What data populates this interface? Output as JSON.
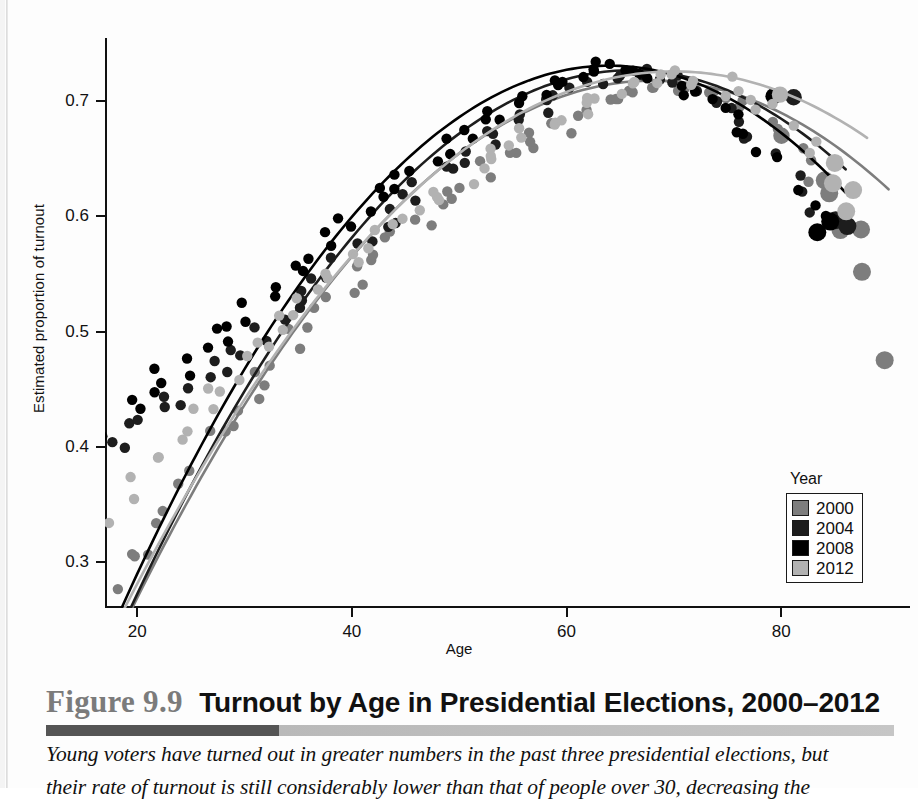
{
  "figure": {
    "number": "Figure 9.9",
    "title": "Turnout by Age in Presidential Elections, 2000–2012",
    "caption_line1": "Young voters have turned out in greater numbers in the past three presidential elections, but",
    "caption_line2": "their rate of turnout is still considerably lower than that of people over 30, decreasing the"
  },
  "legend": {
    "title": "Year",
    "items": [
      {
        "label": "2000",
        "color": "#7d7d7d"
      },
      {
        "label": "2004",
        "color": "#1d1d1d"
      },
      {
        "label": "2008",
        "color": "#000000"
      },
      {
        "label": "2012",
        "color": "#b2b2b2"
      }
    ]
  },
  "chart_data": {
    "type": "scatter",
    "title": "Turnout by Age in Presidential Elections, 2000–2012",
    "xlabel": "Age",
    "ylabel": "Estimated proportion of turnout",
    "xlim": [
      17,
      92
    ],
    "ylim": [
      0.26,
      0.755
    ],
    "xticks": [
      20,
      40,
      60,
      80
    ],
    "yticks": [
      0.3,
      0.4,
      0.5,
      0.6,
      0.7
    ],
    "ytick_labels": [
      "0.3",
      "0.4",
      "0.5",
      "0.6",
      "0.7"
    ],
    "xtick_labels": [
      "20",
      "40",
      "60",
      "80"
    ],
    "grid": false,
    "legend_position": "lower-right",
    "series": [
      {
        "name": "2000",
        "color": "#7d7d7d",
        "fit": {
          "kind": "quadratic",
          "vertex_x": 68,
          "vertex_y": 0.718,
          "curvature": -0.000195,
          "x_start": 18,
          "x_end": 90
        },
        "points": [
          [
            18,
            0.277
          ],
          [
            19,
            0.302
          ],
          [
            20,
            0.303
          ],
          [
            21,
            0.306
          ],
          [
            22,
            0.337
          ],
          [
            23,
            0.347
          ],
          [
            24,
            0.372
          ],
          [
            25,
            0.378
          ],
          [
            26,
            0.409
          ],
          [
            27,
            0.414
          ],
          [
            28,
            0.419
          ],
          [
            29,
            0.435
          ],
          [
            30,
            0.437
          ],
          [
            31,
            0.455
          ],
          [
            32,
            0.468
          ],
          [
            33,
            0.474
          ],
          [
            34,
            0.487
          ],
          [
            35,
            0.498
          ],
          [
            36,
            0.503
          ],
          [
            37,
            0.516
          ],
          [
            38,
            0.526
          ],
          [
            39,
            0.536
          ],
          [
            40,
            0.543
          ],
          [
            41,
            0.556
          ],
          [
            42,
            0.562
          ],
          [
            43,
            0.571
          ],
          [
            44,
            0.579
          ],
          [
            45,
            0.588
          ],
          [
            46,
            0.597
          ],
          [
            47,
            0.602
          ],
          [
            48,
            0.611
          ],
          [
            49,
            0.613
          ],
          [
            50,
            0.624
          ],
          [
            51,
            0.629
          ],
          [
            52,
            0.633
          ],
          [
            53,
            0.645
          ],
          [
            54,
            0.652
          ],
          [
            55,
            0.657
          ],
          [
            56,
            0.664
          ],
          [
            57,
            0.668
          ],
          [
            58,
            0.672
          ],
          [
            59,
            0.677
          ],
          [
            60,
            0.684
          ],
          [
            61,
            0.688
          ],
          [
            62,
            0.692
          ],
          [
            63,
            0.697
          ],
          [
            64,
            0.701
          ],
          [
            65,
            0.703
          ],
          [
            66,
            0.708
          ],
          [
            67,
            0.711
          ],
          [
            68,
            0.714
          ],
          [
            69,
            0.715
          ],
          [
            70,
            0.716
          ],
          [
            71,
            0.714
          ],
          [
            72,
            0.712
          ],
          [
            73,
            0.711
          ],
          [
            74,
            0.706
          ],
          [
            75,
            0.702
          ],
          [
            76,
            0.698
          ],
          [
            77,
            0.692
          ],
          [
            78,
            0.686
          ],
          [
            79,
            0.678
          ],
          [
            80,
            0.671
          ],
          [
            81,
            0.659
          ],
          [
            82,
            0.647
          ],
          [
            83,
            0.634
          ],
          [
            84,
            0.621
          ],
          [
            85,
            0.631
          ],
          [
            86,
            0.592
          ],
          [
            87,
            0.588
          ],
          [
            88,
            0.552
          ],
          [
            89,
            0.478
          ]
        ]
      },
      {
        "name": "2004",
        "color": "#1d1d1d",
        "fit": {
          "kind": "quadratic",
          "vertex_x": 66,
          "vertex_y": 0.727,
          "curvature": -0.000215,
          "x_start": 18,
          "x_end": 86
        },
        "points": [
          [
            18,
            0.401
          ],
          [
            19,
            0.407
          ],
          [
            20,
            0.418
          ],
          [
            21,
            0.424
          ],
          [
            22,
            0.432
          ],
          [
            23,
            0.441
          ],
          [
            24,
            0.438
          ],
          [
            25,
            0.452
          ],
          [
            26,
            0.459
          ],
          [
            27,
            0.462
          ],
          [
            28,
            0.471
          ],
          [
            29,
            0.478
          ],
          [
            30,
            0.487
          ],
          [
            31,
            0.491
          ],
          [
            32,
            0.503
          ],
          [
            33,
            0.509
          ],
          [
            34,
            0.516
          ],
          [
            35,
            0.524
          ],
          [
            36,
            0.538
          ],
          [
            37,
            0.547
          ],
          [
            38,
            0.552
          ],
          [
            39,
            0.563
          ],
          [
            40,
            0.572
          ],
          [
            41,
            0.578
          ],
          [
            42,
            0.589
          ],
          [
            43,
            0.597
          ],
          [
            44,
            0.604
          ],
          [
            45,
            0.613
          ],
          [
            46,
            0.618
          ],
          [
            47,
            0.629
          ],
          [
            48,
            0.637
          ],
          [
            49,
            0.641
          ],
          [
            50,
            0.651
          ],
          [
            51,
            0.657
          ],
          [
            52,
            0.663
          ],
          [
            53,
            0.669
          ],
          [
            54,
            0.676
          ],
          [
            55,
            0.681
          ],
          [
            56,
            0.687
          ],
          [
            57,
            0.691
          ],
          [
            58,
            0.697
          ],
          [
            59,
            0.701
          ],
          [
            60,
            0.706
          ],
          [
            61,
            0.709
          ],
          [
            62,
            0.713
          ],
          [
            63,
            0.716
          ],
          [
            64,
            0.719
          ],
          [
            65,
            0.722
          ],
          [
            66,
            0.724
          ],
          [
            67,
            0.723
          ],
          [
            68,
            0.722
          ],
          [
            69,
            0.719
          ],
          [
            70,
            0.718
          ],
          [
            71,
            0.714
          ],
          [
            72,
            0.709
          ],
          [
            73,
            0.703
          ],
          [
            74,
            0.698
          ],
          [
            75,
            0.691
          ],
          [
            76,
            0.683
          ],
          [
            77,
            0.674
          ],
          [
            78,
            0.664
          ],
          [
            79,
            0.654
          ],
          [
            80,
            0.707
          ],
          [
            81,
            0.631
          ],
          [
            82,
            0.618
          ],
          [
            83,
            0.604
          ],
          [
            84,
            0.592
          ],
          [
            85,
            0.593
          ]
        ]
      },
      {
        "name": "2008",
        "color": "#000000",
        "fit": {
          "kind": "quadratic",
          "vertex_x": 64,
          "vertex_y": 0.731,
          "curvature": -0.000228,
          "x_start": 18,
          "x_end": 86
        },
        "points": [
          [
            18,
            0.412
          ],
          [
            19,
            0.441
          ],
          [
            20,
            0.436
          ],
          [
            21,
            0.452
          ],
          [
            22,
            0.455
          ],
          [
            23,
            0.469
          ],
          [
            24,
            0.462
          ],
          [
            25,
            0.478
          ],
          [
            26,
            0.482
          ],
          [
            27,
            0.495
          ],
          [
            28,
            0.498
          ],
          [
            29,
            0.502
          ],
          [
            30,
            0.512
          ],
          [
            31,
            0.522
          ],
          [
            32,
            0.533
          ],
          [
            33,
            0.541
          ],
          [
            34,
            0.548
          ],
          [
            35,
            0.556
          ],
          [
            36,
            0.566
          ],
          [
            37,
            0.572
          ],
          [
            38,
            0.583
          ],
          [
            39,
            0.591
          ],
          [
            40,
            0.598
          ],
          [
            41,
            0.607
          ],
          [
            42,
            0.614
          ],
          [
            43,
            0.622
          ],
          [
            44,
            0.628
          ],
          [
            45,
            0.637
          ],
          [
            46,
            0.644
          ],
          [
            47,
            0.651
          ],
          [
            48,
            0.657
          ],
          [
            49,
            0.664
          ],
          [
            50,
            0.671
          ],
          [
            51,
            0.676
          ],
          [
            52,
            0.682
          ],
          [
            53,
            0.688
          ],
          [
            54,
            0.692
          ],
          [
            55,
            0.697
          ],
          [
            56,
            0.702
          ],
          [
            57,
            0.707
          ],
          [
            58,
            0.711
          ],
          [
            59,
            0.716
          ],
          [
            60,
            0.719
          ],
          [
            61,
            0.722
          ],
          [
            62,
            0.726
          ],
          [
            63,
            0.728
          ],
          [
            64,
            0.731
          ],
          [
            65,
            0.729
          ],
          [
            66,
            0.727
          ],
          [
            67,
            0.726
          ],
          [
            68,
            0.723
          ],
          [
            69,
            0.719
          ],
          [
            70,
            0.716
          ],
          [
            71,
            0.711
          ],
          [
            72,
            0.706
          ],
          [
            73,
            0.699
          ],
          [
            74,
            0.693
          ],
          [
            75,
            0.686
          ],
          [
            76,
            0.678
          ],
          [
            77,
            0.668
          ],
          [
            78,
            0.659
          ],
          [
            79,
            0.648
          ],
          [
            80,
            0.706
          ],
          [
            81,
            0.626
          ],
          [
            82,
            0.613
          ],
          [
            83,
            0.601
          ],
          [
            84,
            0.588
          ],
          [
            85,
            0.594
          ]
        ]
      },
      {
        "name": "2012",
        "color": "#b2b2b2",
        "fit": {
          "kind": "quadratic",
          "vertex_x": 70,
          "vertex_y": 0.726,
          "curvature": -0.000178,
          "x_start": 18,
          "x_end": 88
        },
        "points": [
          [
            18,
            0.338
          ],
          [
            19,
            0.351
          ],
          [
            20,
            0.377
          ],
          [
            21,
            0.386
          ],
          [
            22,
            0.392
          ],
          [
            23,
            0.408
          ],
          [
            24,
            0.414
          ],
          [
            25,
            0.429
          ],
          [
            26,
            0.431
          ],
          [
            27,
            0.448
          ],
          [
            28,
            0.452
          ],
          [
            29,
            0.461
          ],
          [
            30,
            0.476
          ],
          [
            31,
            0.482
          ],
          [
            32,
            0.493
          ],
          [
            33,
            0.502
          ],
          [
            34,
            0.511
          ],
          [
            35,
            0.518
          ],
          [
            36,
            0.527
          ],
          [
            37,
            0.536
          ],
          [
            38,
            0.544
          ],
          [
            39,
            0.552
          ],
          [
            40,
            0.561
          ],
          [
            41,
            0.569
          ],
          [
            42,
            0.576
          ],
          [
            43,
            0.584
          ],
          [
            44,
            0.591
          ],
          [
            45,
            0.598
          ],
          [
            46,
            0.606
          ],
          [
            47,
            0.612
          ],
          [
            48,
            0.619
          ],
          [
            49,
            0.626
          ],
          [
            50,
            0.632
          ],
          [
            51,
            0.639
          ],
          [
            52,
            0.645
          ],
          [
            53,
            0.651
          ],
          [
            54,
            0.657
          ],
          [
            55,
            0.663
          ],
          [
            56,
            0.668
          ],
          [
            57,
            0.673
          ],
          [
            58,
            0.679
          ],
          [
            59,
            0.683
          ],
          [
            60,
            0.688
          ],
          [
            61,
            0.693
          ],
          [
            62,
            0.697
          ],
          [
            63,
            0.701
          ],
          [
            64,
            0.706
          ],
          [
            65,
            0.709
          ],
          [
            66,
            0.713
          ],
          [
            67,
            0.716
          ],
          [
            68,
            0.719
          ],
          [
            69,
            0.722
          ],
          [
            70,
            0.724
          ],
          [
            71,
            0.723
          ],
          [
            72,
            0.722
          ],
          [
            73,
            0.719
          ],
          [
            74,
            0.717
          ],
          [
            75,
            0.713
          ],
          [
            76,
            0.709
          ],
          [
            77,
            0.704
          ],
          [
            78,
            0.698
          ],
          [
            79,
            0.692
          ],
          [
            80,
            0.709
          ],
          [
            81,
            0.676
          ],
          [
            82,
            0.666
          ],
          [
            83,
            0.656
          ],
          [
            84,
            0.645
          ],
          [
            85,
            0.632
          ],
          [
            86,
            0.618
          ],
          [
            87,
            0.604
          ]
        ]
      }
    ]
  }
}
